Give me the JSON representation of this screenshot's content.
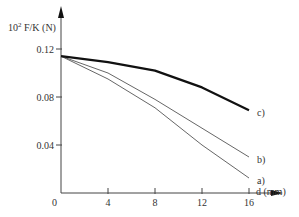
{
  "chart_data": {
    "type": "line",
    "title": "",
    "xlabel": "d (mm)",
    "ylabel": "10² F/K (N)",
    "ylabel_base": "10",
    "ylabel_exp": "2",
    "ylabel_rest": " F/K (N)",
    "origin_label": "0",
    "xlim": [
      0,
      16
    ],
    "ylim": [
      0,
      0.12
    ],
    "x_ticks": [
      4,
      8,
      12,
      16
    ],
    "x_tick_labels": [
      "4",
      "8",
      "12",
      "16"
    ],
    "y_ticks": [
      0.04,
      0.08,
      0.12
    ],
    "y_tick_labels": [
      "0.04",
      "0.08",
      "0.12"
    ],
    "grid": false,
    "legend": "inline labels at line ends",
    "x": [
      0,
      4,
      8,
      12,
      16
    ],
    "series": [
      {
        "name": "a)",
        "values": [
          0.114,
          0.095,
          0.071,
          0.04,
          0.0125
        ],
        "style": "thin"
      },
      {
        "name": "b)",
        "values": [
          0.114,
          0.1,
          0.078,
          0.054,
          0.03
        ],
        "style": "thin"
      },
      {
        "name": "c)",
        "values": [
          0.114,
          0.109,
          0.102,
          0.088,
          0.069
        ],
        "style": "thick"
      }
    ]
  }
}
